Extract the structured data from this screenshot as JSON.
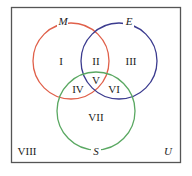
{
  "diagram": {
    "type": "venn-3-set",
    "universe": {
      "label": "U",
      "border_color": "#555555"
    },
    "sets": [
      {
        "id": "M",
        "label": "M",
        "color": "#e0604a"
      },
      {
        "id": "E",
        "label": "E",
        "color": "#3b3b8f"
      },
      {
        "id": "S",
        "label": "S",
        "color": "#5aa862"
      }
    ],
    "regions": [
      {
        "id": "I",
        "label": "I",
        "description": "M only"
      },
      {
        "id": "II",
        "label": "II",
        "description": "M and E only"
      },
      {
        "id": "III",
        "label": "III",
        "description": "E only"
      },
      {
        "id": "IV",
        "label": "IV",
        "description": "M and S only"
      },
      {
        "id": "V",
        "label": "V",
        "description": "M and E and S"
      },
      {
        "id": "VI",
        "label": "VI",
        "description": "E and S only"
      },
      {
        "id": "VII",
        "label": "VII",
        "description": "S only"
      },
      {
        "id": "VIII",
        "label": "VIII",
        "description": "outside all sets"
      }
    ]
  }
}
